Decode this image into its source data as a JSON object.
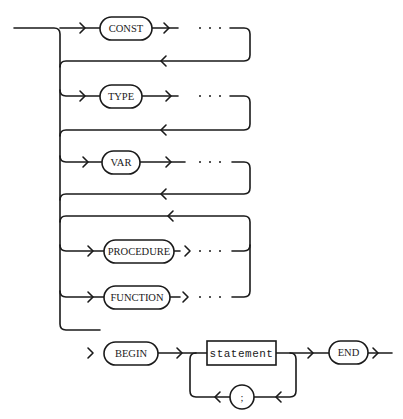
{
  "diagram": {
    "type": "syntax-diagram",
    "terminals": [
      {
        "id": "const",
        "label": "CONST"
      },
      {
        "id": "type",
        "label": "TYPE"
      },
      {
        "id": "var",
        "label": "VAR"
      },
      {
        "id": "procedure",
        "label": "PROCEDURE"
      },
      {
        "id": "function",
        "label": "FUNCTION"
      },
      {
        "id": "begin",
        "label": "BEGIN"
      },
      {
        "id": "end",
        "label": "END"
      },
      {
        "id": "semicolon",
        "label": ";"
      }
    ],
    "nonterminals": [
      {
        "id": "statement",
        "label": "statement"
      }
    ],
    "ellipsis": "· · ·",
    "colors": {
      "stroke": "#1a1a1a",
      "background": "#ffffff"
    }
  }
}
